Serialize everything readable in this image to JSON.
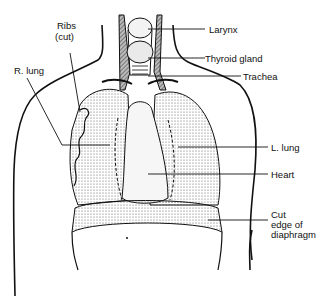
{
  "diagram": {
    "labels": {
      "larynx": "Larynx",
      "thyroid": "Thyroid gland",
      "trachea": "Trachea",
      "ribs_1": "Ribs",
      "ribs_2": "(cut)",
      "r_lung": "R. lung",
      "l_lung": "L. lung",
      "heart": "Heart",
      "diaphragm_1": "Cut",
      "diaphragm_2": "edge of",
      "diaphragm_3": "diaphragm"
    },
    "colors": {
      "line": "#111111",
      "shade": "#9a9a9a",
      "background": "#ffffff"
    }
  }
}
